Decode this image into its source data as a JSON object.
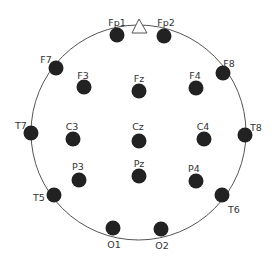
{
  "colors": {
    "head_outline": "#555555",
    "electrode": "#222222",
    "label": "#333333"
  },
  "head": {
    "cx": 138.5,
    "cy": 132.5,
    "r": 107.5
  },
  "nose": {
    "points": "132,33 139,19 147,33"
  },
  "electrodes": [
    {
      "id": "Fp1",
      "x": 117,
      "y": 35,
      "lx": 117,
      "ly": 23
    },
    {
      "id": "Fp2",
      "x": 164,
      "y": 36,
      "lx": 166,
      "ly": 23
    },
    {
      "id": "F7",
      "x": 56,
      "y": 68,
      "lx": 46,
      "ly": 60
    },
    {
      "id": "F8",
      "x": 223,
      "y": 73,
      "lx": 229,
      "ly": 64
    },
    {
      "id": "F3",
      "x": 84,
      "y": 87,
      "lx": 83,
      "ly": 76
    },
    {
      "id": "Fz",
      "x": 139,
      "y": 91,
      "lx": 139,
      "ly": 79
    },
    {
      "id": "F4",
      "x": 196,
      "y": 88,
      "lx": 195,
      "ly": 76
    },
    {
      "id": "T7",
      "x": 31,
      "y": 133,
      "lx": 21,
      "ly": 126
    },
    {
      "id": "C3",
      "x": 73,
      "y": 139,
      "lx": 72,
      "ly": 127
    },
    {
      "id": "Cz",
      "x": 139,
      "y": 141,
      "lx": 138,
      "ly": 127
    },
    {
      "id": "C4",
      "x": 204,
      "y": 139,
      "lx": 203,
      "ly": 127
    },
    {
      "id": "T8",
      "x": 245,
      "y": 135,
      "lx": 256,
      "ly": 128
    },
    {
      "id": "P3",
      "x": 79,
      "y": 180,
      "lx": 78,
      "ly": 167
    },
    {
      "id": "Pz",
      "x": 139,
      "y": 176,
      "lx": 139,
      "ly": 164
    },
    {
      "id": "P4",
      "x": 196,
      "y": 181,
      "lx": 194,
      "ly": 169
    },
    {
      "id": "T5",
      "x": 54,
      "y": 195,
      "lx": 39,
      "ly": 198
    },
    {
      "id": "T6",
      "x": 222,
      "y": 195,
      "lx": 234,
      "ly": 210
    },
    {
      "id": "O1",
      "x": 113,
      "y": 228,
      "lx": 114,
      "ly": 245
    },
    {
      "id": "O2",
      "x": 161,
      "y": 229,
      "lx": 162,
      "ly": 246
    }
  ]
}
